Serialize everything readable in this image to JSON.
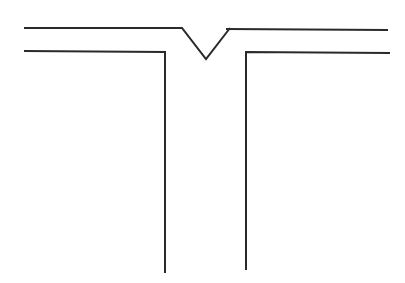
{
  "diagram": {
    "width": 405,
    "height": 283,
    "stroke_color": "#2a2a2a",
    "stroke_width": 2,
    "background": "#ffffff",
    "paths": {
      "top_edge_left": "M24,28 L182,28 L206,59 L230,28",
      "top_edge_right": "M226,29 L388,30",
      "inner_left": "M24,51 L165,52 L165,273",
      "inner_right": "M390,53 L246,52 L246,270"
    }
  }
}
